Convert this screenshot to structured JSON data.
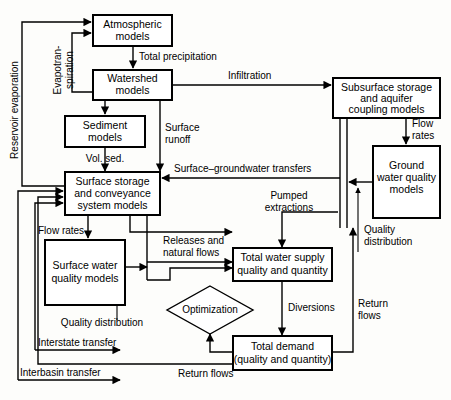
{
  "diagram": {
    "nodes": [
      {
        "id": "atmospheric",
        "lines": [
          "Atmospheric",
          "models"
        ],
        "shape": "rect"
      },
      {
        "id": "watershed",
        "lines": [
          "Watershed",
          "models"
        ],
        "shape": "rect"
      },
      {
        "id": "sediment",
        "lines": [
          "Sediment",
          "models"
        ],
        "shape": "rect"
      },
      {
        "id": "surface_storage",
        "lines": [
          "Surface storage",
          "and conveyance",
          "system models"
        ],
        "shape": "rect"
      },
      {
        "id": "surface_water_quality",
        "lines": [
          "Surface water",
          "quality models"
        ],
        "shape": "rect"
      },
      {
        "id": "subsurface",
        "lines": [
          "Subsurface storage",
          "and aquifer",
          "coupling models"
        ],
        "shape": "rect"
      },
      {
        "id": "ground_water_quality",
        "lines": [
          "Ground",
          "water quality",
          "models"
        ],
        "shape": "rect"
      },
      {
        "id": "total_supply",
        "lines": [
          "Total water supply",
          "quality and quantity"
        ],
        "shape": "rect"
      },
      {
        "id": "total_demand",
        "lines": [
          "Total demand",
          "(quality and quantity)"
        ],
        "shape": "rect"
      },
      {
        "id": "optimization",
        "lines": [
          "Optimization"
        ],
        "shape": "diamond"
      }
    ],
    "edge_labels": [
      {
        "id": "total-precipitation",
        "text": "Total precipitation"
      },
      {
        "id": "evapotranspiration",
        "text": "Evapotran-",
        "text2": "spiration"
      },
      {
        "id": "reservoir-evaporation",
        "text": "Reservoir evaporation"
      },
      {
        "id": "infiltration",
        "text": "Infiltration"
      },
      {
        "id": "surface-runoff",
        "text": "Surface",
        "text2": "runoff"
      },
      {
        "id": "vol-sed",
        "text": "Vol. sed."
      },
      {
        "id": "surface-groundwater-transfers",
        "text": "Surface–groundwater transfers"
      },
      {
        "id": "flow-rates-right",
        "text": "Flow",
        "text2": "rates"
      },
      {
        "id": "flow-rates-left",
        "text": "Flow rates"
      },
      {
        "id": "pumped-extractions",
        "text": "Pumped",
        "text2": "extractions"
      },
      {
        "id": "quality-distribution-right",
        "text": "Quality",
        "text2": "distribution"
      },
      {
        "id": "quality-distribution-left",
        "text": "Quality distribution"
      },
      {
        "id": "releases-natural-flows",
        "text": "Releases and",
        "text2": "natural flows"
      },
      {
        "id": "diversions",
        "text": "Diversions"
      },
      {
        "id": "return-flows-right",
        "text": "Return",
        "text2": "flows"
      },
      {
        "id": "return-flows-bottom",
        "text": "Return flows"
      },
      {
        "id": "interstate-transfer",
        "text": "Interstate transfer"
      },
      {
        "id": "interbasin-transfer",
        "text": "Interbasin transfer"
      }
    ],
    "colors": {
      "background": "#fdfdfb",
      "stroke": "#000000",
      "node_fill": "#ffffff"
    }
  }
}
